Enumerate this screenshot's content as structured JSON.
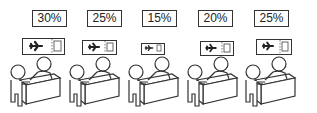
{
  "panels": [
    {
      "label": "30%",
      "cx": 49,
      "ticket_w": 42,
      "ticket_h": 15
    },
    {
      "label": "25%",
      "cx": 108,
      "ticket_w": 34,
      "ticket_h": 13
    },
    {
      "label": "15%",
      "cx": 160,
      "ticket_w": 22,
      "ticket_h": 10
    },
    {
      "label": "20%",
      "cx": 219,
      "ticket_w": 32,
      "ticket_h": 13
    },
    {
      "label": "25%",
      "cx": 277,
      "ticket_w": 34,
      "ticket_h": 14
    }
  ],
  "icons": {
    "ticket": "airplane-ticket-icon",
    "scene": "check-in-counter-scene"
  },
  "colors": {
    "line": "#333333",
    "bg": "#ffffff"
  }
}
